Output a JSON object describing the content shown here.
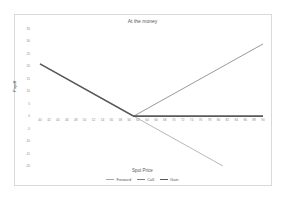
{
  "chart_data": {
    "type": "line",
    "title": "At the money",
    "xlabel": "Spot Price",
    "ylabel": "Payoff",
    "x_ticks": [
      40,
      42,
      44,
      46,
      48,
      50,
      52,
      54,
      56,
      58,
      60,
      62,
      64,
      66,
      68,
      70,
      72,
      74,
      76,
      78,
      80,
      82,
      84,
      86,
      88,
      90
    ],
    "y_ticks": [
      35,
      30,
      25,
      20,
      15,
      10,
      5,
      0,
      -5,
      -10,
      -15,
      -20
    ],
    "xlim": [
      40,
      90
    ],
    "ylim": [
      -20,
      35
    ],
    "grid": false,
    "legend_position": "bottom",
    "strike": 61,
    "series": [
      {
        "name": "Forward",
        "color": "#a6a6a6",
        "width": 0.8,
        "points": [
          [
            40,
            21
          ],
          [
            61,
            0
          ],
          [
            81,
            -20
          ]
        ]
      },
      {
        "name": "Call",
        "color": "#7f7f7f",
        "width": 0.8,
        "points": [
          [
            61,
            0
          ],
          [
            90,
            29
          ]
        ]
      },
      {
        "name": "Gain",
        "color": "#595959",
        "width": 1.6,
        "points": [
          [
            40,
            21
          ],
          [
            61,
            0
          ],
          [
            90,
            0
          ]
        ]
      }
    ]
  }
}
